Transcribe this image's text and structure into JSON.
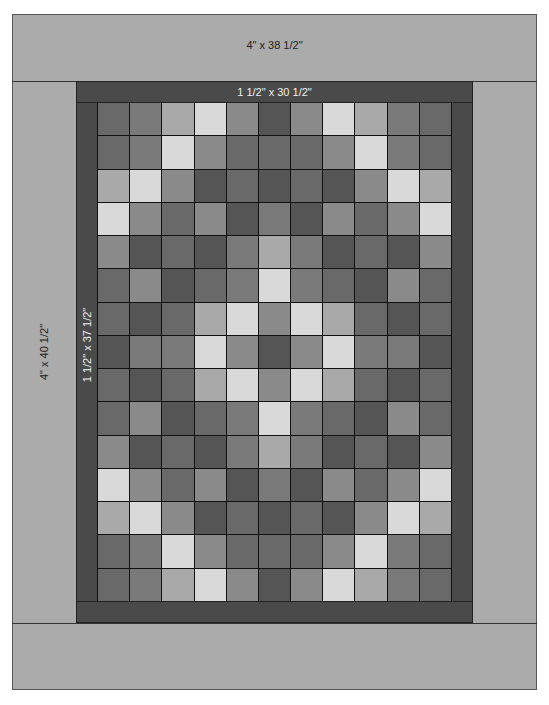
{
  "diagram": {
    "borders": {
      "outer_top": "4\" x 38 1/2\"",
      "outer_side": "4\" x 40 1/2\"",
      "inner_top": "1 1/2\" x 30 1/2\"",
      "inner_side": "1 1/2\" x 37 1/2\""
    },
    "colors": {
      "background": "#ffffff",
      "outer_border": "#ababab",
      "inner_border": "#4a4a4a",
      "grid_line": "#111111",
      "shades": {
        "L1": "#d9d9d9",
        "L2": "#a9a9a9",
        "M": "#8a8a8a",
        "Mm": "#7a7a7a",
        "D": "#696969",
        "DD": "#555555"
      }
    },
    "grid": {
      "columns": 11,
      "rows": 15,
      "cells": [
        [
          "D",
          "Mm",
          "L2",
          "L1",
          "M",
          "DD",
          "M",
          "L1",
          "L2",
          "Mm",
          "D"
        ],
        [
          "D",
          "Mm",
          "L1",
          "M",
          "D",
          "D",
          "D",
          "M",
          "L1",
          "Mm",
          "D"
        ],
        [
          "L2",
          "L1",
          "M",
          "DD",
          "D",
          "DD",
          "D",
          "DD",
          "M",
          "L1",
          "L2"
        ],
        [
          "L1",
          "M",
          "D",
          "M",
          "DD",
          "Mm",
          "DD",
          "M",
          "D",
          "M",
          "L1"
        ],
        [
          "M",
          "DD",
          "D",
          "DD",
          "Mm",
          "L2",
          "Mm",
          "DD",
          "D",
          "DD",
          "M"
        ],
        [
          "D",
          "M",
          "DD",
          "D",
          "Mm",
          "L1",
          "Mm",
          "D",
          "DD",
          "M",
          "D"
        ],
        [
          "D",
          "DD",
          "D",
          "L2",
          "L1",
          "M",
          "L1",
          "L2",
          "D",
          "DD",
          "D"
        ],
        [
          "DD",
          "Mm",
          "Mm",
          "L1",
          "M",
          "DD",
          "M",
          "L1",
          "Mm",
          "Mm",
          "DD"
        ],
        [
          "D",
          "DD",
          "D",
          "L2",
          "L1",
          "M",
          "L1",
          "L2",
          "D",
          "DD",
          "D"
        ],
        [
          "D",
          "M",
          "DD",
          "D",
          "Mm",
          "L1",
          "Mm",
          "D",
          "DD",
          "M",
          "D"
        ],
        [
          "M",
          "DD",
          "D",
          "DD",
          "Mm",
          "L2",
          "Mm",
          "DD",
          "D",
          "DD",
          "M"
        ],
        [
          "L1",
          "M",
          "D",
          "M",
          "DD",
          "Mm",
          "DD",
          "M",
          "D",
          "M",
          "L1"
        ],
        [
          "L2",
          "L1",
          "M",
          "DD",
          "D",
          "DD",
          "D",
          "DD",
          "M",
          "L1",
          "L2"
        ],
        [
          "D",
          "Mm",
          "L1",
          "M",
          "D",
          "D",
          "D",
          "M",
          "L1",
          "Mm",
          "D"
        ],
        [
          "D",
          "Mm",
          "L2",
          "L1",
          "M",
          "DD",
          "M",
          "L1",
          "L2",
          "Mm",
          "D"
        ]
      ]
    }
  }
}
